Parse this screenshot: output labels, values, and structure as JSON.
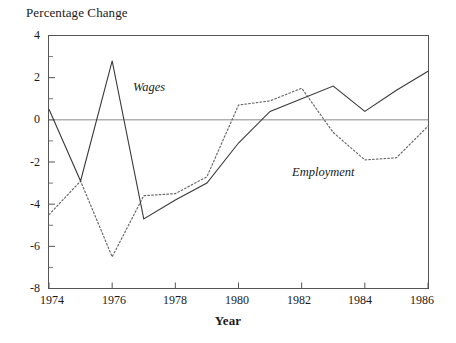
{
  "chart_data": {
    "type": "line",
    "title": "",
    "ylabel": "Percentage Change",
    "xlabel": "Year",
    "xlim": [
      1974,
      1986
    ],
    "ylim": [
      -8,
      4
    ],
    "grid": false,
    "legend_position": "inline-annotation",
    "x": [
      1974,
      1975,
      1976,
      1977,
      1978,
      1979,
      1980,
      1981,
      1982,
      1983,
      1984,
      1985,
      1986
    ],
    "xticks": [
      "1974",
      "1976",
      "1978",
      "1980",
      "1982",
      "1984",
      "1986"
    ],
    "yticks": [
      "4",
      "2",
      "0",
      "-2",
      "-4",
      "-6",
      "-8"
    ],
    "series": [
      {
        "name": "Wages",
        "style": "solid",
        "color": "#3a3a3a",
        "values": [
          0.5,
          -2.9,
          2.8,
          -4.7,
          -3.8,
          -3.0,
          -1.1,
          0.4,
          1.0,
          1.6,
          0.4,
          1.4,
          2.3
        ]
      },
      {
        "name": "Employment",
        "style": "dotted",
        "color": "#6a6a6a",
        "values": [
          -4.5,
          -2.9,
          -6.5,
          -3.6,
          -3.5,
          -2.7,
          0.7,
          0.9,
          1.5,
          -0.6,
          -1.9,
          -1.8,
          -0.3
        ]
      }
    ]
  },
  "axes": {
    "ylabel": "Percentage Change",
    "xlabel": "Year",
    "ytick_labels": [
      "4",
      "2",
      "0",
      "-2",
      "-4",
      "-6",
      "-8"
    ],
    "xtick_labels": [
      "1974",
      "1976",
      "1978",
      "1980",
      "1982",
      "1984",
      "1986"
    ]
  },
  "annotations": {
    "wages": "Wages",
    "employment": "Employment"
  },
  "colors": {
    "wages_line": "#3a3a3a",
    "employment_line": "#6a6a6a",
    "axis": "#555555",
    "zero_line": "#8a8a8a",
    "text": "#1a1a1a",
    "background": "#ffffff"
  }
}
